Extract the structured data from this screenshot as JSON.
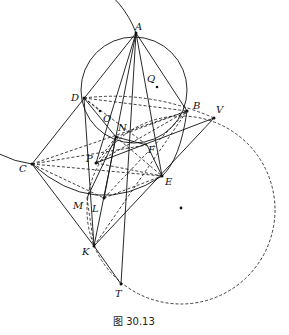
{
  "figure": {
    "caption": "图 30.13",
    "points": {
      "A": {
        "label": "A",
        "x": 136,
        "y": 33
      },
      "Q": {
        "label": "Q",
        "x": 157,
        "y": 87
      },
      "D": {
        "label": "D",
        "x": 84,
        "y": 98
      },
      "O": {
        "label": "O",
        "x": 100,
        "y": 111
      },
      "N": {
        "label": "N",
        "x": 116,
        "y": 129
      },
      "B": {
        "label": "B",
        "x": 187,
        "y": 111
      },
      "V": {
        "label": "V",
        "x": 214,
        "y": 118
      },
      "F": {
        "label": "F",
        "x": 147,
        "y": 152
      },
      "P": {
        "label": "P",
        "x": 96,
        "y": 163
      },
      "C": {
        "label": "C",
        "x": 32,
        "y": 164
      },
      "E": {
        "label": "E",
        "x": 162,
        "y": 176
      },
      "M": {
        "label": "M",
        "x": 87,
        "y": 198
      },
      "L": {
        "label": "L",
        "x": 104,
        "y": 198
      },
      "K": {
        "label": "K",
        "x": 94,
        "y": 246
      },
      "T": {
        "label": "T",
        "x": 121,
        "y": 284
      }
    },
    "circles": [
      {
        "name": "big-circle",
        "style": "solid",
        "through": [
          "A",
          "D",
          "C"
        ]
      },
      {
        "name": "small-circle",
        "style": "solid",
        "through": [
          "A",
          "D",
          "B"
        ]
      },
      {
        "name": "dashed-circle",
        "style": "dashed",
        "through": [
          "V",
          "T"
        ],
        "center_marked": true
      }
    ]
  }
}
